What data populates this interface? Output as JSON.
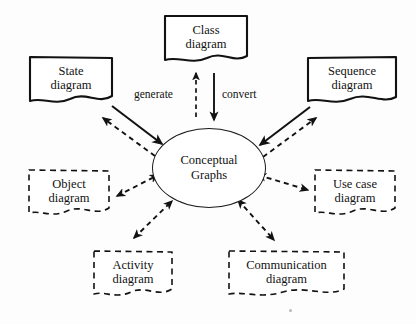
{
  "diagram": {
    "background_color": "#fdfdfd",
    "stroke_color": "#121212",
    "center": {
      "id": "conceptual-graphs",
      "label": "Conceptual\nGraphs",
      "shape": "ellipse",
      "border_style": "solid",
      "border_width": 1.2,
      "x": 152,
      "y": 128,
      "width": 112,
      "height": 78,
      "font_size": 12.5
    },
    "nodes": [
      {
        "id": "class-diagram",
        "label": "Class\ndiagram",
        "shape": "note",
        "border_style": "solid",
        "border_width": 2.1,
        "x": 163,
        "y": 14,
        "width": 86,
        "height": 52,
        "font_size": 12.5
      },
      {
        "id": "state-diagram",
        "label": "State\ndiagram",
        "shape": "note",
        "border_style": "solid",
        "border_width": 2.1,
        "x": 28,
        "y": 55,
        "width": 86,
        "height": 52,
        "font_size": 12.5
      },
      {
        "id": "sequence-diagram",
        "label": "Sequence\ndiagram",
        "shape": "note",
        "border_style": "solid",
        "border_width": 2.1,
        "x": 306,
        "y": 55,
        "width": 92,
        "height": 52,
        "font_size": 12.5
      },
      {
        "id": "object-diagram",
        "label": "Object\ndiagram",
        "shape": "note",
        "border_style": "dashed",
        "border_width": 1.6,
        "x": 27,
        "y": 168,
        "width": 84,
        "height": 52,
        "font_size": 12.5
      },
      {
        "id": "use-case-diagram",
        "label": "Use case\ndiagram",
        "shape": "note",
        "border_style": "dashed",
        "border_width": 1.6,
        "x": 313,
        "y": 168,
        "width": 84,
        "height": 52,
        "font_size": 12.5
      },
      {
        "id": "activity-diagram",
        "label": "Activity\ndiagram",
        "shape": "note",
        "border_style": "dashed",
        "border_width": 1.6,
        "x": 92,
        "y": 249,
        "width": 82,
        "height": 52,
        "font_size": 12.5
      },
      {
        "id": "communication-diagram",
        "label": "Communication\ndiagram",
        "shape": "note",
        "border_style": "dashed",
        "border_width": 1.6,
        "x": 227,
        "y": 249,
        "width": 119,
        "height": 52,
        "font_size": 12.5
      }
    ],
    "edge_labels": [
      {
        "id": "generate-label",
        "text": "generate",
        "x": 134,
        "y": 88
      },
      {
        "id": "convert-label",
        "text": "convert",
        "x": 222,
        "y": 88
      }
    ],
    "edges": [
      {
        "id": "generate-edge",
        "from": "conceptual-graphs",
        "to": "class-diagram",
        "style": "dashed",
        "arrowheads": "end",
        "label": "generate"
      },
      {
        "id": "convert-edge",
        "from": "class-diagram",
        "to": "conceptual-graphs",
        "style": "solid",
        "arrowheads": "end",
        "label": "convert"
      },
      {
        "id": "state-to-cg-edge",
        "from": "state-diagram",
        "to": "conceptual-graphs",
        "style": "solid",
        "arrowheads": "end",
        "label": ""
      },
      {
        "id": "cg-to-state-edge",
        "from": "conceptual-graphs",
        "to": "state-diagram",
        "style": "dashed",
        "arrowheads": "end",
        "label": ""
      },
      {
        "id": "sequence-to-cg-edge",
        "from": "sequence-diagram",
        "to": "conceptual-graphs",
        "style": "solid",
        "arrowheads": "end",
        "label": ""
      },
      {
        "id": "cg-to-sequence-edge",
        "from": "conceptual-graphs",
        "to": "sequence-diagram",
        "style": "dashed",
        "arrowheads": "end",
        "label": ""
      },
      {
        "id": "object-cg-edge",
        "from": "object-diagram",
        "to": "conceptual-graphs",
        "style": "dashed",
        "arrowheads": "both",
        "label": ""
      },
      {
        "id": "usecase-cg-edge",
        "from": "use-case-diagram",
        "to": "conceptual-graphs",
        "style": "dashed",
        "arrowheads": "both",
        "label": ""
      },
      {
        "id": "activity-cg-edge",
        "from": "activity-diagram",
        "to": "conceptual-graphs",
        "style": "dashed",
        "arrowheads": "both",
        "label": ""
      },
      {
        "id": "communication-cg-edge",
        "from": "communication-diagram",
        "to": "conceptual-graphs",
        "style": "dashed",
        "arrowheads": "both",
        "label": ""
      }
    ]
  }
}
